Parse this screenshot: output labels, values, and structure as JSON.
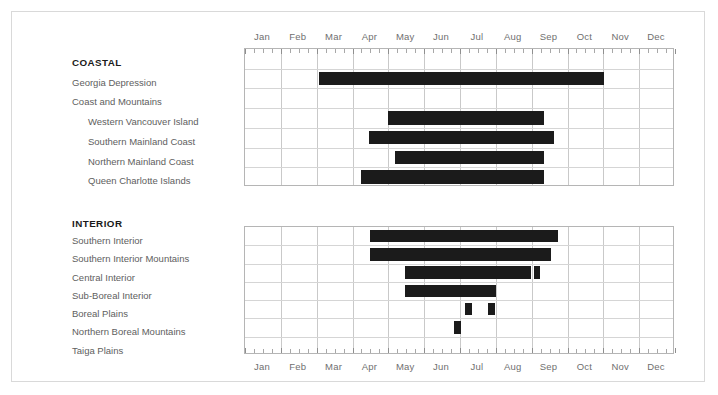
{
  "figure": {
    "background": "#ffffff",
    "bar_color": "#1b1b1b",
    "grid_color": "#c9c9c9",
    "border_color": "#d9d9d9"
  },
  "axis": {
    "months": [
      "Jan",
      "Feb",
      "Mar",
      "Apr",
      "May",
      "Jun",
      "Jul",
      "Aug",
      "Sep",
      "Oct",
      "Nov",
      "Dec"
    ]
  },
  "sections": [
    {
      "id": "coastal",
      "title": "COASTAL",
      "rows": [
        {
          "label": "COASTAL",
          "style": "group"
        },
        {
          "label": "Georgia Depression",
          "style": "normal"
        },
        {
          "label": "Coast and Mountains",
          "style": "normal"
        },
        {
          "label": "Western Vancouver Island",
          "style": "indent"
        },
        {
          "label": "Southern Mainland Coast",
          "style": "indent"
        },
        {
          "label": "Northern Mainland Coast",
          "style": "indent"
        },
        {
          "label": "Queen Charlotte Islands",
          "style": "indent"
        }
      ]
    },
    {
      "id": "interior",
      "title": "INTERIOR",
      "rows": [
        {
          "label": "Southern Interior",
          "style": "normal"
        },
        {
          "label": "Southern Interior Mountains",
          "style": "normal"
        },
        {
          "label": "Central Interior",
          "style": "normal"
        },
        {
          "label": "Sub-Boreal Interior",
          "style": "normal"
        },
        {
          "label": "Boreal Plains",
          "style": "normal"
        },
        {
          "label": "Northern Boreal Mountains",
          "style": "normal"
        },
        {
          "label": "Taiga Plains",
          "style": "normal"
        }
      ]
    }
  ],
  "chart_data": {
    "type": "bar",
    "title": "",
    "xlabel": "",
    "ylabel": "",
    "orientation": "horizontal-gantt",
    "x_axis": {
      "type": "month",
      "categories": [
        "Jan",
        "Feb",
        "Mar",
        "Apr",
        "May",
        "Jun",
        "Jul",
        "Aug",
        "Sep",
        "Oct",
        "Nov",
        "Dec"
      ],
      "range_months": [
        0,
        12
      ],
      "ticks_per_month": 4,
      "labels_top": true,
      "labels_bottom": true
    },
    "grid": true,
    "legend": null,
    "groups": [
      {
        "name": "COASTAL",
        "series": [
          {
            "name": "Georgia Depression",
            "bars": [
              {
                "start": 2.07,
                "end": 10.02
              }
            ]
          },
          {
            "name": "Coast and Mountains",
            "bars": []
          },
          {
            "name": "Western Vancouver Island",
            "bars": [
              {
                "start": 3.99,
                "end": 8.35
              }
            ]
          },
          {
            "name": "Southern Mainland Coast",
            "bars": [
              {
                "start": 3.46,
                "end": 8.63
              }
            ]
          },
          {
            "name": "Northern Mainland Coast",
            "bars": [
              {
                "start": 4.19,
                "end": 8.35
              }
            ]
          },
          {
            "name": "Queen Charlotte Islands",
            "bars": [
              {
                "start": 3.24,
                "end": 8.35
              }
            ]
          }
        ]
      },
      {
        "name": "INTERIOR",
        "series": [
          {
            "name": "Southern Interior",
            "bars": [
              {
                "start": 3.49,
                "end": 8.74
              }
            ]
          },
          {
            "name": "Southern Interior Mountains",
            "bars": [
              {
                "start": 3.49,
                "end": 8.54
              }
            ]
          },
          {
            "name": "Central Interior",
            "bars": [
              {
                "start": 4.46,
                "end": 7.99
              },
              {
                "start": 8.07,
                "end": 8.24
              }
            ]
          },
          {
            "name": "Sub-Boreal Interior",
            "bars": [
              {
                "start": 4.46,
                "end": 7.01
              }
            ]
          },
          {
            "name": "Boreal Plains",
            "bars": [
              {
                "start": 6.14,
                "end": 6.34
              },
              {
                "start": 6.78,
                "end": 6.98
              }
            ]
          },
          {
            "name": "Northern Boreal Mountains",
            "bars": [
              {
                "start": 5.83,
                "end": 6.03
              }
            ]
          },
          {
            "name": "Taiga Plains",
            "bars": []
          }
        ]
      }
    ]
  },
  "geometry": {
    "grid_left": 232,
    "grid_width": 430,
    "coastal_top": 47,
    "coastal_height": 138,
    "interior_top": 225,
    "interior_height": 128,
    "label_col_left": 60,
    "coastal_label_top": 45,
    "interior_label_top": 206
  }
}
